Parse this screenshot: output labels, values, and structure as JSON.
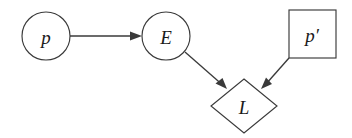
{
  "diagram": {
    "type": "flow-graph",
    "background_color": "#ffffff",
    "stroke_color": "#3a3a3a",
    "label_color": "#1a1a1a",
    "nodes": [
      {
        "id": "p",
        "label": "p",
        "shape": "circle",
        "cx": 46,
        "cy": 36,
        "r": 24
      },
      {
        "id": "E",
        "label": "E",
        "shape": "circle",
        "cx": 166,
        "cy": 36,
        "r": 24
      },
      {
        "id": "p-prime",
        "label": "p′",
        "shape": "square",
        "x": 289,
        "y": 10,
        "width": 47,
        "height": 48
      },
      {
        "id": "L",
        "label": "L",
        "shape": "diamond",
        "cx": 244,
        "cy": 106,
        "rx": 33,
        "ry": 27
      }
    ],
    "edges": [
      {
        "id": "p-to-E",
        "from": "p",
        "to": "E",
        "label": "",
        "direction": "right",
        "x1": 70,
        "y1": 36,
        "x2": 141,
        "y2": 36
      },
      {
        "id": "E-to-L",
        "from": "E",
        "to": "L",
        "label": "",
        "direction": "down-right",
        "x1": 185,
        "y1": 52,
        "x2": 226,
        "y2": 88
      },
      {
        "id": "pprime-to-L",
        "from": "p-prime",
        "to": "L",
        "label": "",
        "direction": "down-left",
        "x1": 288,
        "y1": 58,
        "x2": 262,
        "y2": 88
      }
    ]
  }
}
